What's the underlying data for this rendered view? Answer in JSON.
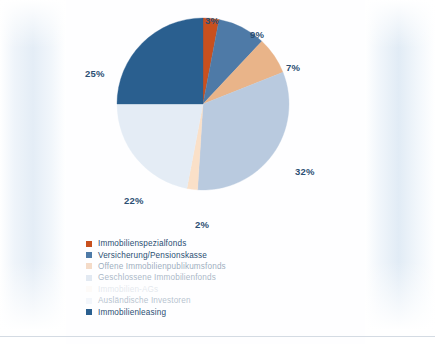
{
  "chart_data": {
    "type": "pie",
    "title": "",
    "subtitle": "",
    "xlabel": "",
    "ylabel": "",
    "legend_position": "bottom-left",
    "grid": false,
    "units": "percent",
    "total": 100,
    "categories": [
      "Immobilienspezialfonds",
      "Versicherung/Pensionskasse",
      "Offene Immobilienpublikumsfonds",
      "Geschlossene Immobilienfonds",
      "Immobilien-AGs",
      "Ausländische Investoren",
      "Immobilienleasing"
    ],
    "values": [
      3,
      9,
      7,
      32,
      2,
      22,
      25
    ],
    "labels": [
      "3%",
      "9%",
      "7%",
      "32%",
      "2%",
      "22%",
      "25%"
    ],
    "colors": [
      "#c8501e",
      "#4e7aa7",
      "#e9b489",
      "#b9cadf",
      "#fae0c8",
      "#e4ecf5",
      "#2a5f8f"
    ],
    "slices": [
      {
        "label": "Immobilienspezialfonds",
        "value": 3,
        "display": "3%",
        "color": "#c8501e"
      },
      {
        "label": "Versicherung/Pensionskasse",
        "value": 9,
        "display": "9%",
        "color": "#4e7aa7"
      },
      {
        "label": "Offene Immobilienpublikumsfonds",
        "value": 7,
        "display": "7%",
        "color": "#e9b489"
      },
      {
        "label": "Geschlossene Immobilienfonds",
        "value": 32,
        "display": "32%",
        "color": "#b9cadf"
      },
      {
        "label": "Immobilien-AGs",
        "value": 2,
        "display": "2%",
        "color": "#fae0c8"
      },
      {
        "label": "Ausländische Investoren",
        "value": 22,
        "display": "22%",
        "color": "#e4ecf5"
      },
      {
        "label": "Immobilienleasing",
        "value": 25,
        "display": "25%",
        "color": "#2a5f8f"
      }
    ]
  },
  "legend": {
    "items": [
      {
        "label": "Immobilienspezialfonds",
        "color": "#c8501e"
      },
      {
        "label": "Versicherung/Pensionskasse",
        "color": "#4e7aa7"
      },
      {
        "label": "Offene Immobilienpublikumsfonds",
        "color": "#e9b489"
      },
      {
        "label": "Geschlossene Immobilienfonds",
        "color": "#b9cadf"
      },
      {
        "label": "Immobilien-AGs",
        "color": "#fae0c8"
      },
      {
        "label": "Ausländische Investoren",
        "color": "#dfe9f4"
      },
      {
        "label": "Immobilienleasing",
        "color": "#2a5f8f"
      }
    ]
  },
  "data_labels": {
    "l0": "3%",
    "l1": "9%",
    "l2": "7%",
    "l3": "32%",
    "l4": "2%",
    "l5": "22%",
    "l6": "25%"
  }
}
